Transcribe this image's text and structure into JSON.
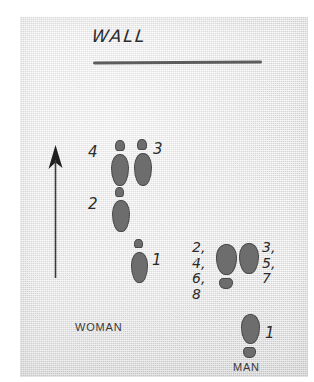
{
  "figure": {
    "title": "WALL",
    "background_color": "#e9e9e9",
    "footprint_color": "#6d6d6d",
    "line_color": "#5d5d5d",
    "ink_color": "#2b2b2b"
  },
  "wall": {
    "label": "WALL"
  },
  "arrow": {
    "name": "direction-of-travel-arrow",
    "direction": "up"
  },
  "dancers": {
    "woman": {
      "label": "WOMAN",
      "steps": [
        {
          "number": "4",
          "label_x": 88,
          "label_y": 145,
          "foot_x": 111,
          "foot_y": 140,
          "orientation": "up"
        },
        {
          "number": "3",
          "label_x": 153,
          "label_y": 142,
          "foot_x": 134,
          "foot_y": 139,
          "orientation": "up"
        },
        {
          "number": "2",
          "label_x": 88,
          "label_y": 197,
          "foot_x": 112,
          "foot_y": 187,
          "orientation": "up"
        },
        {
          "number": "1",
          "label_x": 152,
          "label_y": 253,
          "foot_x": 131,
          "foot_y": 239,
          "orientation": "up"
        }
      ]
    },
    "man": {
      "label": "MAN",
      "step_groups": [
        {
          "numbers": "2,\n4,\n6,\n8",
          "label_x": 192,
          "label_y": 240,
          "foot_x": 216,
          "foot_y": 244,
          "orientation": "down"
        },
        {
          "numbers": "3,\n5,\n7",
          "label_x": 262,
          "label_y": 240,
          "foot_x": 239,
          "foot_y": 243,
          "orientation": "down"
        },
        {
          "numbers": "1",
          "label_x": 265,
          "label_y": 326,
          "foot_x": 241,
          "foot_y": 314,
          "orientation": "down"
        }
      ]
    }
  }
}
